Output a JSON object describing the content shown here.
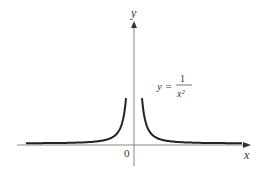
{
  "chart_data": {
    "type": "line",
    "title": "",
    "xlabel": "x",
    "ylabel": "y",
    "origin_label": "0",
    "annotation": {
      "lhs": "y =",
      "numerator": "1",
      "denominator": "x²"
    },
    "series": [
      {
        "name": "y = 1/x^2",
        "function": "1/x^2"
      }
    ],
    "grid": false,
    "legend": "none"
  }
}
